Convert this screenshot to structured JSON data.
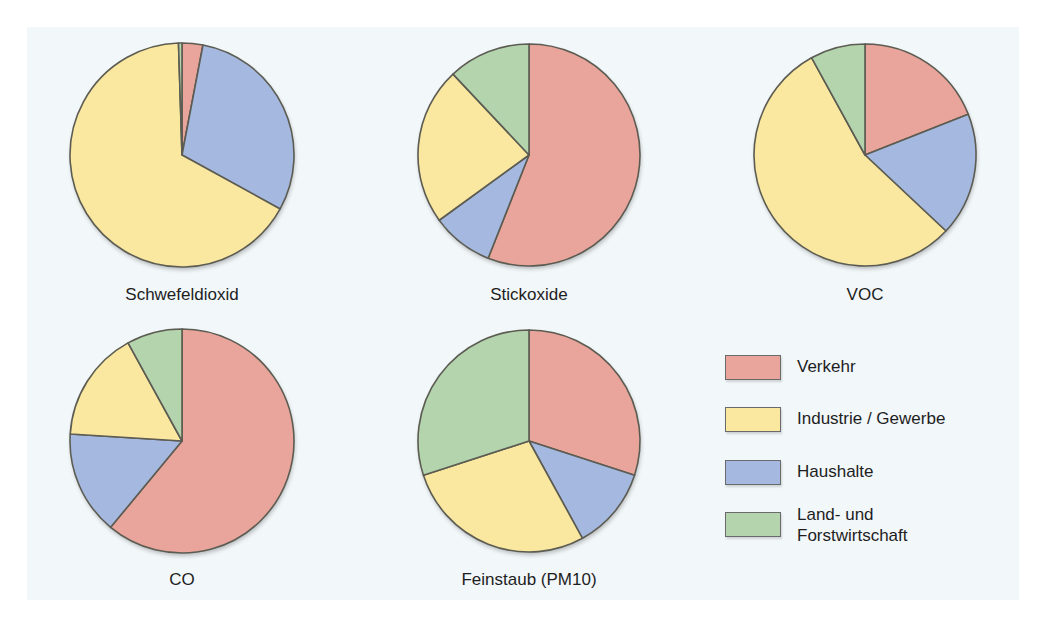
{
  "colors": {
    "Verkehr": "#e9a59b",
    "Industrie / Gewerbe": "#fbe8a0",
    "Haushalte": "#a4b8e0",
    "Land- und Forstwirtschaft": "#b4d4ae",
    "background": "#f2f7fa",
    "outline": "#5c5c52"
  },
  "legend": {
    "items": [
      {
        "label": "Verkehr",
        "color": "#e9a59b"
      },
      {
        "label": "Industrie / Gewerbe",
        "color": "#fbe8a0"
      },
      {
        "label": "Haushalte",
        "color": "#a4b8e0"
      },
      {
        "label": "Land- und\nForstwirtschaft",
        "color": "#b4d4ae"
      }
    ]
  },
  "chart_data": [
    {
      "type": "pie",
      "title": "Schwefeldioxid",
      "categories": [
        "Verkehr",
        "Haushalte",
        "Industrie / Gewerbe",
        "Land- und Forstwirtschaft"
      ],
      "values": [
        3,
        30,
        66.5,
        0.5
      ],
      "center": [
        182,
        155
      ],
      "radius": 112
    },
    {
      "type": "pie",
      "title": "Stickoxide",
      "categories": [
        "Verkehr",
        "Haushalte",
        "Industrie / Gewerbe",
        "Land- und Forstwirtschaft"
      ],
      "values": [
        56,
        9,
        23,
        12
      ],
      "center": [
        529,
        155
      ],
      "radius": 111
    },
    {
      "type": "pie",
      "title": "VOC",
      "categories": [
        "Verkehr",
        "Haushalte",
        "Industrie / Gewerbe",
        "Land- und Forstwirtschaft"
      ],
      "values": [
        19,
        18,
        55,
        8
      ],
      "center": [
        865,
        155
      ],
      "radius": 111
    },
    {
      "type": "pie",
      "title": "CO",
      "categories": [
        "Verkehr",
        "Haushalte",
        "Industrie / Gewerbe",
        "Land- und Forstwirtschaft"
      ],
      "values": [
        61,
        15,
        16,
        8
      ],
      "center": [
        182,
        441
      ],
      "radius": 112
    },
    {
      "type": "pie",
      "title": "Feinstaub (PM10)",
      "categories": [
        "Verkehr",
        "Haushalte",
        "Industrie / Gewerbe",
        "Land- und Forstwirtschaft"
      ],
      "values": [
        30,
        12,
        28,
        30
      ],
      "center": [
        529,
        441
      ],
      "radius": 111
    }
  ]
}
